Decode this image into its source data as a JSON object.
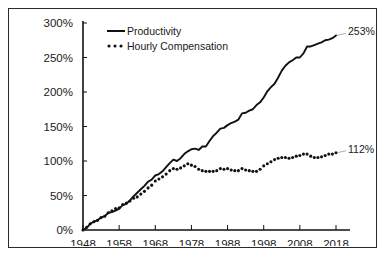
{
  "figure": {
    "background_color": "#ffffff",
    "border_color": "#2b2b2b",
    "line_color": "#111111"
  },
  "legend": {
    "position": "top-left-inside",
    "entries": [
      {
        "label": "Productivity",
        "style": "solid"
      },
      {
        "label": "Hourly Compensation",
        "style": "dotted"
      }
    ]
  },
  "annotations": [
    {
      "name": "productivity-end-label",
      "text": "253%",
      "series": "Productivity"
    },
    {
      "name": "compensation-end-label",
      "text": "112%",
      "series": "Hourly Compensation"
    }
  ],
  "axes": {
    "y_ticks": [
      "0%",
      "50%",
      "100%",
      "150%",
      "200%",
      "250%",
      "300%"
    ],
    "x_ticks": [
      "1948",
      "1958",
      "1968",
      "1978",
      "1988",
      "1998",
      "2008",
      "2018"
    ]
  },
  "chart_data": {
    "type": "line",
    "title": "",
    "subtitle": "",
    "xlabel": "",
    "ylabel": "",
    "xlim": [
      1948,
      2018
    ],
    "ylim": [
      0,
      300
    ],
    "grid": false,
    "legend_position": "top-left-inside",
    "y_tick_values": [
      0,
      50,
      100,
      150,
      200,
      250,
      300
    ],
    "y_tick_labels": [
      "0%",
      "50%",
      "100%",
      "150%",
      "200%",
      "250%",
      "300%"
    ],
    "x_tick_values": [
      1948,
      1958,
      1968,
      1978,
      1988,
      1998,
      2008,
      2018
    ],
    "x_tick_labels": [
      "1948",
      "1958",
      "1968",
      "1978",
      "1988",
      "1998",
      "2008",
      "2018"
    ],
    "x": [
      1948,
      1949,
      1950,
      1951,
      1952,
      1953,
      1954,
      1955,
      1956,
      1957,
      1958,
      1959,
      1960,
      1961,
      1962,
      1963,
      1964,
      1965,
      1966,
      1967,
      1968,
      1969,
      1970,
      1971,
      1972,
      1973,
      1974,
      1975,
      1976,
      1977,
      1978,
      1979,
      1980,
      1981,
      1982,
      1983,
      1984,
      1985,
      1986,
      1987,
      1988,
      1989,
      1990,
      1991,
      1992,
      1993,
      1994,
      1995,
      1996,
      1997,
      1998,
      1999,
      2000,
      2001,
      2002,
      2003,
      2004,
      2005,
      2006,
      2007,
      2008,
      2009,
      2010,
      2011,
      2012,
      2013,
      2014,
      2015,
      2016,
      2017,
      2018
    ],
    "series": [
      {
        "name": "Productivity",
        "style": "solid",
        "end_value": 253,
        "end_label": "253%",
        "values": [
          0,
          3,
          9,
          12,
          14,
          18,
          20,
          25,
          26,
          28,
          31,
          36,
          38,
          43,
          49,
          54,
          59,
          64,
          70,
          73,
          79,
          81,
          85,
          91,
          97,
          102,
          100,
          104,
          110,
          114,
          117,
          118,
          116,
          121,
          121,
          129,
          136,
          141,
          147,
          148,
          152,
          155,
          157,
          160,
          169,
          170,
          173,
          175,
          181,
          185,
          192,
          201,
          207,
          212,
          221,
          231,
          238,
          243,
          246,
          250,
          250,
          256,
          266,
          266,
          268,
          270,
          272,
          275,
          276,
          278,
          282
        ],
        "note": "Net productivity growth since 1948, indexed to 0% in 1948"
      },
      {
        "name": "Hourly Compensation",
        "style": "dotted",
        "end_value": 112,
        "end_label": "112%",
        "values": [
          0,
          4,
          9,
          12,
          14,
          18,
          20,
          25,
          28,
          31,
          32,
          37,
          39,
          42,
          46,
          48,
          52,
          56,
          61,
          65,
          71,
          74,
          77,
          81,
          86,
          89,
          88,
          90,
          93,
          96,
          94,
          92,
          88,
          86,
          85,
          85,
          85,
          86,
          89,
          88,
          89,
          87,
          86,
          86,
          89,
          87,
          86,
          85,
          85,
          88,
          93,
          96,
          99,
          102,
          104,
          105,
          105,
          104,
          105,
          107,
          108,
          110,
          110,
          107,
          105,
          105,
          106,
          108,
          110,
          110,
          112
        ],
        "note": "Hourly compensation of production/nonsupervisory workers since 1948, indexed to 0% in 1948"
      }
    ]
  }
}
